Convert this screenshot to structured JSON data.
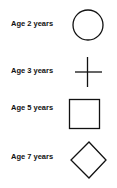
{
  "legend": {
    "items": [
      {
        "label": "Age 2 years",
        "symbol": "circle-icon"
      },
      {
        "label": "Age 3 years",
        "symbol": "plus-icon"
      },
      {
        "label": "Age 5 years",
        "symbol": "square-icon"
      },
      {
        "label": "Age 7 years",
        "symbol": "diamond-icon"
      }
    ],
    "stroke_color": "#111111",
    "background": "#ffffff"
  }
}
